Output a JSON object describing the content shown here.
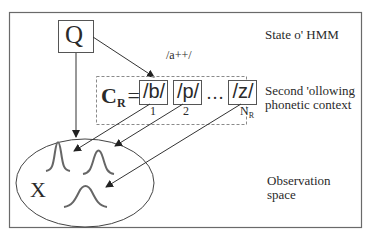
{
  "diagram": {
    "state_node": {
      "label": "Q"
    },
    "arrow_label": "/a++/",
    "context_set": {
      "symbol": "C",
      "subscript": "R",
      "equals": "=",
      "items": [
        {
          "label": "/b/",
          "index": "1"
        },
        {
          "label": "/p/",
          "index": "2"
        },
        {
          "label": "/z/",
          "index": "N",
          "index_sub": "R"
        }
      ],
      "ellipsis": "…"
    },
    "observation_node": {
      "label": "X"
    },
    "side_labels": {
      "state": "State o' HMM",
      "context_line1": "Second 'ollowing",
      "context_line2": "phonetic context",
      "observation_line1": "Observation",
      "observation_line2": "space"
    },
    "colors": {
      "line": "#333333",
      "border": "#555555",
      "dashed": "#888888",
      "curve": "#555555"
    }
  }
}
